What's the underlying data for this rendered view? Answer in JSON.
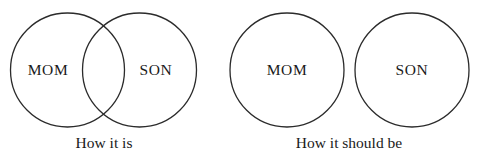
{
  "figure": {
    "type": "venn-diagram-meme",
    "background_color": "#ffffff",
    "stroke_color": "#2b2b2b",
    "text_color": "#1a1a1a"
  },
  "panels": [
    {
      "id": "how-it-is",
      "caption": "How it is",
      "overlapping": true,
      "sets": [
        {
          "id": "mom",
          "label": "MOM"
        },
        {
          "id": "son",
          "label": "SON"
        }
      ]
    },
    {
      "id": "how-it-should-be",
      "caption": "How it should be",
      "overlapping": false,
      "sets": [
        {
          "id": "mom",
          "label": "MOM"
        },
        {
          "id": "son",
          "label": "SON"
        }
      ]
    }
  ]
}
